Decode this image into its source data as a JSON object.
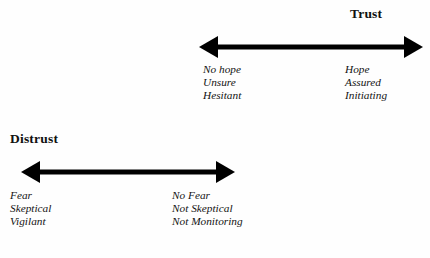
{
  "figure": {
    "background_color": "#fefefe",
    "ink_color": "#000000"
  },
  "scales": [
    {
      "id": "trust",
      "title": "Trust",
      "arrow": {
        "name": "trust-double-arrow",
        "length_px": 223,
        "shaft_thickness_px": 5,
        "arrowhead_width_px": 19,
        "arrowhead_height_px": 22,
        "direction": "double-headed-horizontal"
      },
      "left_pole": {
        "name": "trust-low-pole",
        "lines": [
          "No hope",
          "Unsure",
          "Hesitant"
        ]
      },
      "right_pole": {
        "name": "trust-high-pole",
        "lines": [
          "Hope",
          "Assured",
          "Initiating"
        ]
      }
    },
    {
      "id": "distrust",
      "title": "Distrust",
      "arrow": {
        "name": "distrust-double-arrow",
        "length_px": 213,
        "shaft_thickness_px": 5,
        "arrowhead_width_px": 19,
        "arrowhead_height_px": 22,
        "direction": "double-headed-horizontal"
      },
      "left_pole": {
        "name": "distrust-high-pole",
        "lines": [
          "Fear",
          "Skeptical",
          "Vigilant"
        ]
      },
      "right_pole": {
        "name": "distrust-low-pole",
        "lines": [
          "No Fear",
          "Not Skeptical",
          "Not Monitoring"
        ]
      }
    }
  ]
}
